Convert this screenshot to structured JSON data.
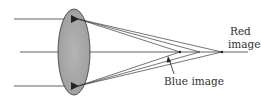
{
  "diagram": {
    "type": "chromatic-aberration",
    "labels": {
      "red_image_line1": "Red",
      "red_image_line2": "image",
      "blue_image": "Blue image"
    },
    "colors": {
      "lens_fill": "#a8a8a8",
      "lens_stroke": "#444444",
      "ray": "#3a3a3a",
      "background": "#ffffff"
    }
  }
}
